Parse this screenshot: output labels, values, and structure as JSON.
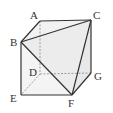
{
  "diagram": {
    "type": "cube-with-tetrahedron",
    "vertices": {
      "A": {
        "label": "A"
      },
      "B": {
        "label": "B"
      },
      "C": {
        "label": "C"
      },
      "D": {
        "label": "D"
      },
      "E": {
        "label": "E"
      },
      "F": {
        "label": "F"
      },
      "G": {
        "label": "G"
      }
    },
    "solid_edges": [
      "AC",
      "AB",
      "BC",
      "BE",
      "EF",
      "FG",
      "GC",
      "BF",
      "CF"
    ],
    "hidden_edges": [
      "AD",
      "DG",
      "DE"
    ],
    "colors": {
      "edge": "#333333",
      "hidden_edge": "#888888",
      "face_fill": "#eeeeee"
    }
  }
}
